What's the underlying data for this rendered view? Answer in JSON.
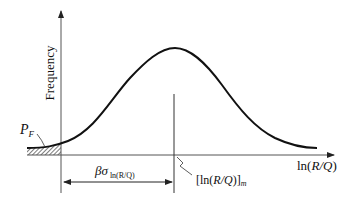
{
  "diagram": {
    "type": "probability-density-curve",
    "y_axis_label": "Frequency",
    "x_axis_label": {
      "prefix": "ln(",
      "italic": "R/Q",
      "suffix": ")"
    },
    "failure_probability_label": {
      "main": "P",
      "sub": "F"
    },
    "median_label": {
      "open": "[ln(",
      "italic": "R/Q",
      "close": ")]",
      "sub": "m"
    },
    "dimension_label": {
      "greek": "βσ",
      "sub": "ln(R/Q)"
    },
    "colors": {
      "line": "#111111",
      "axis": "#555555",
      "background": "#ffffff"
    }
  }
}
